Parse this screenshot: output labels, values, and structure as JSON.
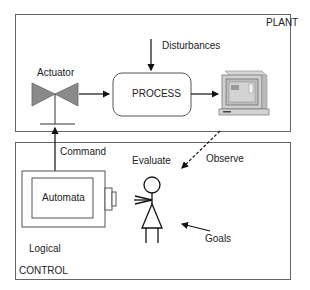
{
  "plant": {
    "title": "PLANT",
    "actuator_label": "Actuator",
    "process_label": "PROCESS",
    "disturbances_label": "Disturbances",
    "monitor_icon": "computer-monitor-icon",
    "valve_icon": "valve-icon"
  },
  "control": {
    "title": "CONTROL",
    "automata_label": "Automata",
    "logical_label": "Logical",
    "evaluate_label": "Evaluate",
    "goals_label": "Goals",
    "person_icon": "stick-figure-icon"
  },
  "connections": {
    "command_label": "Command",
    "observe_label": "Observe"
  },
  "colors": {
    "border": "#666666",
    "valve_fill": "#8a8a8a",
    "arrow": "#111111"
  }
}
